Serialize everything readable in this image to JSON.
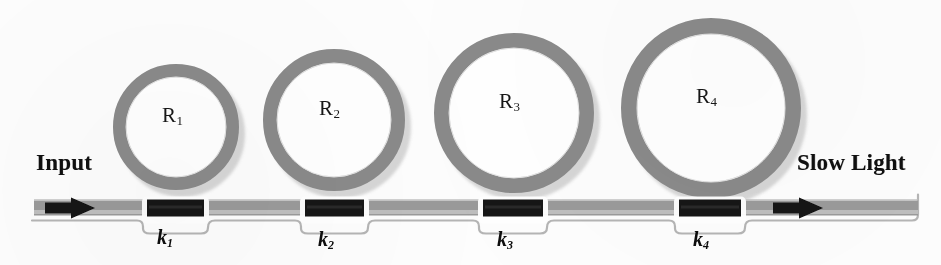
{
  "figure": {
    "type": "schematic-diagram",
    "background_color": "#fdfdfd"
  },
  "colors": {
    "ring_stroke": "#8a8a8a",
    "ring_shadow": "#c9c9c9",
    "bus_waveguide": "#9a9a9a",
    "bus_highlight": "#c4c4c4",
    "coupler_block": "#141414",
    "arrow": "#121212",
    "text": "#101010",
    "outline": "#b5b5b5"
  },
  "ports": {
    "input": {
      "label": "Input",
      "x": 36,
      "y": 150
    },
    "output": {
      "label": "Slow Light",
      "x": 797,
      "y": 150
    }
  },
  "bus": {
    "y": 208,
    "x_start": 34,
    "x_end": 918,
    "thickness": 15
  },
  "rings": [
    {
      "id": "ring-1",
      "label": "R",
      "subscript": "1",
      "cx": 176,
      "cy": 127,
      "outer_radius": 63,
      "ring_width": 13,
      "label_x": 162,
      "label_y": 103
    },
    {
      "id": "ring-2",
      "label": "R",
      "subscript": "2",
      "cx": 334,
      "cy": 120,
      "outer_radius": 71,
      "ring_width": 14,
      "label_x": 319,
      "label_y": 96
    },
    {
      "id": "ring-3",
      "label": "R",
      "subscript": "3",
      "cx": 514,
      "cy": 113,
      "outer_radius": 80,
      "ring_width": 15,
      "label_x": 499,
      "label_y": 89
    },
    {
      "id": "ring-4",
      "label": "R",
      "subscript": "4",
      "cx": 711,
      "cy": 108,
      "outer_radius": 90,
      "ring_width": 16,
      "label_x": 696,
      "label_y": 84
    }
  ],
  "couplers": [
    {
      "id": "coupler-1",
      "label": "k",
      "subscript": "1",
      "x": 147,
      "width": 57,
      "label_x": 157,
      "label_y": 226
    },
    {
      "id": "coupler-2",
      "label": "k",
      "subscript": "2",
      "x": 305,
      "width": 59,
      "label_x": 318,
      "label_y": 228
    },
    {
      "id": "coupler-3",
      "label": "k",
      "subscript": "3",
      "x": 483,
      "width": 60,
      "label_x": 497,
      "label_y": 228
    },
    {
      "id": "coupler-4",
      "label": "k",
      "subscript": "4",
      "x": 679,
      "width": 62,
      "label_x": 693,
      "label_y": 228
    }
  ],
  "arrows": {
    "input_arrow": {
      "name": "input-arrow",
      "x": 45,
      "direction": "right"
    },
    "output_arrow": {
      "name": "output-arrow",
      "x": 773,
      "direction": "right"
    }
  }
}
